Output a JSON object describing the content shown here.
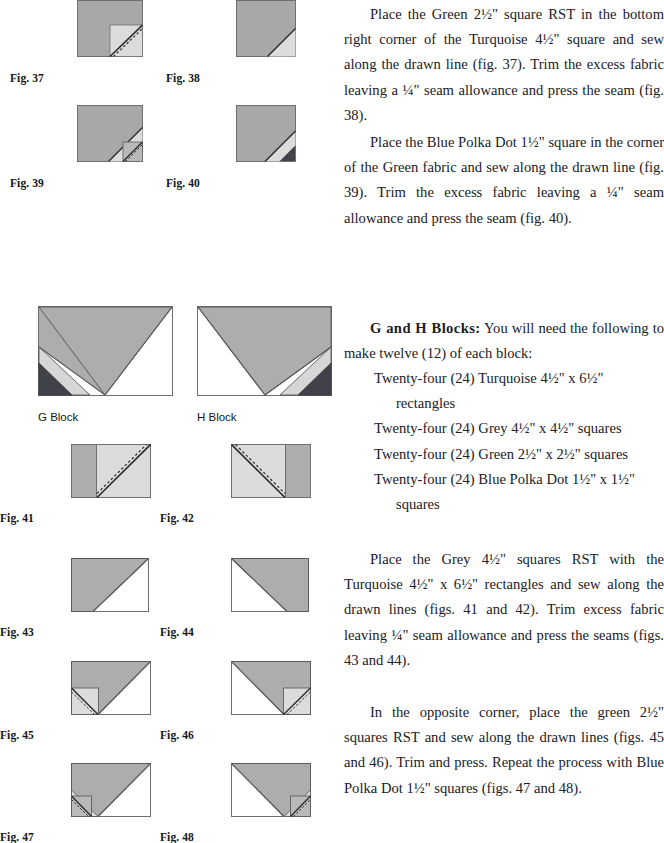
{
  "document": {
    "type": "quilting-pattern-instructions",
    "page_width": 664,
    "page_height": 839
  },
  "figures": [
    {
      "id": "fig37",
      "label": "Fig. 37",
      "caption": "Turquoise 4½\" square with Green 2½\" square RST in bottom right corner, drawn diagonal line with stitch line"
    },
    {
      "id": "fig38",
      "label": "Fig. 38",
      "caption": "Turquoise square after trimming and pressing the Green corner triangle"
    },
    {
      "id": "fig39",
      "label": "Fig. 39",
      "caption": "Blue Polka Dot 1½\" square placed in the corner of the Green fabric with drawn line"
    },
    {
      "id": "fig40",
      "label": "Fig. 40",
      "caption": "Corner after trimming with Blue Polka Dot triangle pressed"
    },
    {
      "id": "gblock",
      "label": "G Block",
      "caption": "Finished G Block"
    },
    {
      "id": "hblock",
      "label": "H Block",
      "caption": "Finished H Block"
    },
    {
      "id": "fig41",
      "label": "Fig. 41",
      "caption": "Grey 4½\" square RST on right of Turquoise 4½\" x 6½\" rectangle, drawn line"
    },
    {
      "id": "fig42",
      "label": "Fig. 42",
      "caption": "Grey 4½\" square RST on left of Turquoise rectangle, drawn line"
    },
    {
      "id": "fig43",
      "label": "Fig. 43",
      "caption": "Unit after trimming and pressing, grey triangle upper left"
    },
    {
      "id": "fig44",
      "label": "Fig. 44",
      "caption": "Unit after trimming and pressing, grey triangle upper right"
    },
    {
      "id": "fig45",
      "label": "Fig. 45",
      "caption": "Green 2½\" square RST in opposite bottom left corner with drawn line"
    },
    {
      "id": "fig46",
      "label": "Fig. 46",
      "caption": "Green 2½\" square RST in opposite bottom right corner with drawn line"
    },
    {
      "id": "fig47",
      "label": "Fig. 47",
      "caption": "Blue Polka Dot 1½\" square on the Green corner, left version"
    },
    {
      "id": "fig48",
      "label": "Fig. 48",
      "caption": "Blue Polka Dot 1½\" square on the Green corner, right version"
    }
  ],
  "colors": {
    "turquoise": "#a8a8a8",
    "grey": "#b5b5b5",
    "green": "#d9d9d9",
    "blue_polka_dot": "#4a4a52",
    "white": "#ffffff",
    "outline": "#555555",
    "drawn_line": "#333333"
  },
  "text": {
    "p1": "Place the Green 2½\" square RST in the bottom right corner of the Turquoise 4½\" square and sew along the drawn line (fig. 37). Trim the excess fabric leaving a ¼\" seam allowance and press the seam (fig. 38).",
    "p2": "Place the Blue Polka Dot 1½\" square in the corner of the Green fabric and sew along the drawn line (fig. 39). Trim the excess fabric leaving a ¼\" seam allowance and press the seam (fig. 40).",
    "gh_heading": "G and H Blocks:",
    "gh_intro": " You will need the following to make twelve (12) of each block:",
    "gh_list": [
      {
        "main": "Twenty-four (24) Turquoise 4½\" x 6½\"",
        "cont": "rectangles"
      },
      {
        "main": "Twenty-four (24) Grey 4½\" x 4½\" squares",
        "cont": ""
      },
      {
        "main": "Twenty-four (24) Green 2½\" x 2½\" squares",
        "cont": ""
      },
      {
        "main": "Twenty-four (24) Blue Polka Dot 1½\" x 1½\"",
        "cont": "squares"
      }
    ],
    "p3": "Place the Grey 4½\" squares RST with the Turquoise 4½\" x 6½\" rectangles and sew along the drawn lines (figs. 41 and 42). Trim excess fabric leaving ¼\" seam allowance and press the seams (figs. 43 and 44).",
    "p4": "In the opposite corner, place the green 2½\" squares RST and sew along the drawn lines (figs. 45 and 46). Trim and press. Repeat the process with Blue Polka Dot 1½\" squares (figs. 47 and 48)."
  }
}
